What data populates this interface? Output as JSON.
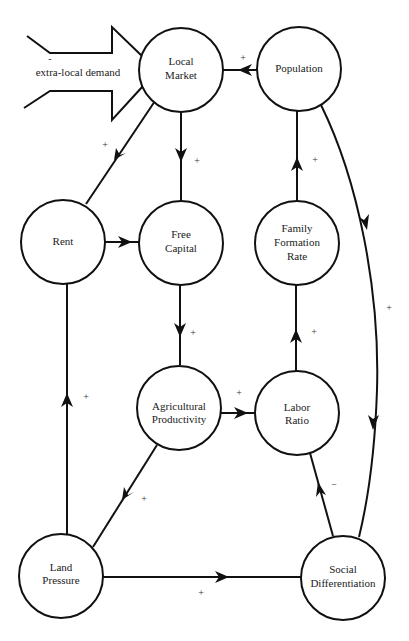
{
  "diagram": {
    "type": "causal-loop",
    "external_input": {
      "label": "extra-local demand",
      "sign": "-",
      "target": "local_market"
    },
    "nodes": [
      {
        "id": "local_market",
        "lines": [
          "Local",
          "Market"
        ]
      },
      {
        "id": "population",
        "lines": [
          "Population"
        ]
      },
      {
        "id": "rent",
        "lines": [
          "Rent"
        ]
      },
      {
        "id": "free_capital",
        "lines": [
          "Free",
          "Capital"
        ]
      },
      {
        "id": "family_formation_rate",
        "lines": [
          "Family",
          "Formation",
          "Rate"
        ]
      },
      {
        "id": "agricultural_productivity",
        "lines": [
          "Agricultural",
          "Productivity"
        ]
      },
      {
        "id": "labor_ratio",
        "lines": [
          "Labor",
          "Ratio"
        ]
      },
      {
        "id": "land_pressure",
        "lines": [
          "Land",
          "Pressure"
        ]
      },
      {
        "id": "social_differentiation",
        "lines": [
          "Social",
          "Differentiation"
        ]
      }
    ],
    "edges": [
      {
        "from": "population",
        "to": "local_market",
        "sign": "+"
      },
      {
        "from": "local_market",
        "to": "rent",
        "sign": "+"
      },
      {
        "from": "local_market",
        "to": "free_capital",
        "sign": "+"
      },
      {
        "from": "rent",
        "to": "free_capital",
        "sign": ""
      },
      {
        "from": "free_capital",
        "to": "agricultural_productivity",
        "sign": "+"
      },
      {
        "from": "agricultural_productivity",
        "to": "labor_ratio",
        "sign": "+"
      },
      {
        "from": "agricultural_productivity",
        "to": "land_pressure",
        "sign": "+"
      },
      {
        "from": "land_pressure",
        "to": "rent",
        "sign": "+"
      },
      {
        "from": "land_pressure",
        "to": "social_differentiation",
        "sign": "+"
      },
      {
        "from": "social_differentiation",
        "to": "labor_ratio",
        "sign": "−"
      },
      {
        "from": "labor_ratio",
        "to": "family_formation_rate",
        "sign": "+"
      },
      {
        "from": "family_formation_rate",
        "to": "population",
        "sign": "+"
      },
      {
        "from": "population",
        "to": "social_differentiation",
        "sign": "+"
      }
    ]
  }
}
